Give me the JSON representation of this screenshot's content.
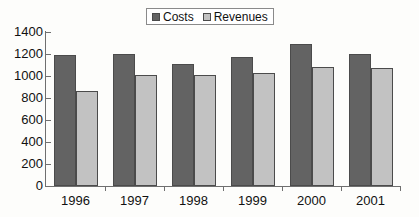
{
  "chart_data": {
    "type": "bar",
    "title": "",
    "xlabel": "",
    "ylabel": "",
    "categories": [
      "1996",
      "1997",
      "1998",
      "1999",
      "2000",
      "2001"
    ],
    "series": [
      {
        "name": "Costs",
        "values": [
          1190,
          1200,
          1110,
          1175,
          1290,
          1200
        ]
      },
      {
        "name": "Revenues",
        "values": [
          865,
          1010,
          1005,
          1025,
          1080,
          1075
        ]
      }
    ],
    "ylim": [
      0,
      1400
    ],
    "ytick_step": 200,
    "yticks": [
      0,
      200,
      400,
      600,
      800,
      1000,
      1200,
      1400
    ],
    "ytick_labels": [
      "0",
      "200",
      "400",
      "600",
      "800",
      "1000",
      "1200",
      "1400"
    ],
    "grid": false,
    "legend_position": "top-center",
    "colors": {
      "costs": "#636363",
      "revenues": "#c2c2c2",
      "bar_border": "#4b4b4b",
      "axis": "#6f6f6f",
      "text": "#111111",
      "background": "#fdfdfb"
    }
  },
  "legend": {
    "entries": [
      {
        "label": "Costs",
        "swatch": "#636363"
      },
      {
        "label": "Revenues",
        "swatch": "#c2c2c2"
      }
    ]
  }
}
